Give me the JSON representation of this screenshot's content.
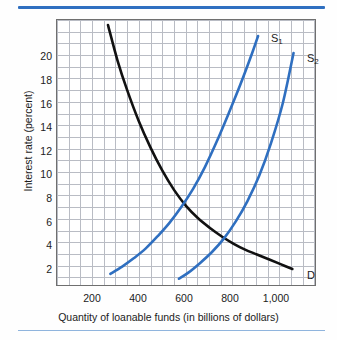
{
  "figure": {
    "rules": {
      "top_color": "#2f6fc0",
      "bottom_color": "#8fb4dd"
    }
  },
  "chart_data": {
    "type": "line",
    "title": "",
    "xlabel": "Quantity of loanable funds (in billions of dollars)",
    "ylabel": "Interest rate (percent)",
    "xlim": [
      100,
      1200
    ],
    "ylim": [
      0,
      22
    ],
    "grid": true,
    "grid_step_x": 50,
    "grid_step_y": 1,
    "legend": "inline-curve-labels",
    "xticks": [
      200,
      400,
      600,
      800,
      1000
    ],
    "xticklabels": [
      "200",
      "400",
      "600",
      "800",
      "1,000"
    ],
    "yticks": [
      2,
      4,
      6,
      8,
      10,
      12,
      14,
      16,
      18,
      20
    ],
    "yticklabels": [
      "2",
      "4",
      "6",
      "8",
      "10",
      "12",
      "14",
      "16",
      "18",
      "20"
    ],
    "series": [
      {
        "name": "D",
        "label": "D",
        "color": "#111111",
        "x": [
          320,
          360,
          400,
          450,
          500,
          550,
          600,
          650,
          700,
          750,
          800,
          850,
          900,
          950,
          1000,
          1050,
          1100
        ],
        "y": [
          21.5,
          18.6,
          16.2,
          13.6,
          11.4,
          9.5,
          7.9,
          6.6,
          5.6,
          4.8,
          4.1,
          3.5,
          3.0,
          2.6,
          2.2,
          1.8,
          1.4
        ]
      },
      {
        "name": "S1",
        "label": "S₁",
        "color": "#2f6fc0",
        "x": [
          330,
          380,
          430,
          480,
          530,
          580,
          630,
          680,
          730,
          780,
          830,
          880,
          930,
          955
        ],
        "y": [
          1.0,
          1.6,
          2.3,
          3.1,
          4.1,
          5.2,
          6.5,
          8.0,
          9.8,
          11.9,
          14.2,
          16.6,
          19.2,
          20.6
        ]
      },
      {
        "name": "S2",
        "label": "S₂",
        "color": "#2f6fc0",
        "x": [
          620,
          660,
          710,
          760,
          810,
          860,
          910,
          960,
          1010,
          1060,
          1105
        ],
        "y": [
          0.6,
          1.1,
          1.9,
          2.8,
          3.9,
          5.3,
          7.0,
          9.1,
          11.8,
          15.1,
          19.2
        ]
      }
    ],
    "annotations": [
      {
        "name": "equilibrium-S1-D",
        "x": 650,
        "y": 6.0
      },
      {
        "name": "equilibrium-S2-D",
        "x": 800,
        "y": 4.0
      }
    ],
    "curve_label_positions": {
      "S1": {
        "x": 272,
        "y": 40
      },
      "S2": {
        "x": 309,
        "y": 60
      },
      "D": {
        "x": 309,
        "y": 276
      }
    }
  }
}
